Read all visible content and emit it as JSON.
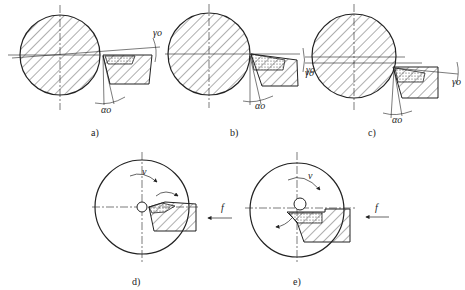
{
  "figure": {
    "panels": [
      {
        "id": "a",
        "caption": "a)",
        "rake_label": "γo",
        "clearance_label": "αo",
        "rake": "positive"
      },
      {
        "id": "b",
        "caption": "b)",
        "rake_label": "γo",
        "clearance_label": "αo",
        "rake": "zero/positive"
      },
      {
        "id": "c",
        "caption": "c)",
        "rake_label": "γo",
        "clearance_label": "αo",
        "rake": "negative"
      },
      {
        "id": "d",
        "caption": "d)",
        "velocity_label": "v",
        "feed_label": "f"
      },
      {
        "id": "e",
        "caption": "e)",
        "velocity_label": "v",
        "feed_label": "f"
      }
    ],
    "colors": {
      "line": "#222222",
      "background": "#ffffff"
    }
  }
}
